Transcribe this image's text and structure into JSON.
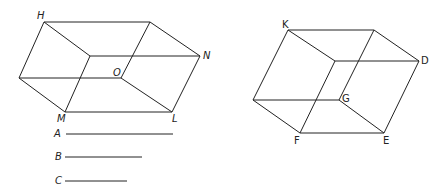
{
  "figure_left": {
    "labels": {
      "H": "H",
      "N": "N",
      "O": "O",
      "M": "M",
      "L": "L"
    },
    "vertices": {
      "H": [
        44,
        22
      ],
      "BR": [
        150,
        22
      ],
      "FTL": [
        90,
        56
      ],
      "N": [
        200,
        56
      ],
      "LEFT": [
        19,
        78
      ],
      "O": [
        121,
        78
      ],
      "M": [
        65,
        112
      ],
      "L": [
        172,
        112
      ]
    }
  },
  "figure_right": {
    "labels": {
      "K": "K",
      "D": "D",
      "G": "G",
      "F": "F",
      "E": "E"
    },
    "vertices": {
      "K": [
        288,
        30
      ],
      "BR": [
        374,
        30
      ],
      "FT": [
        335,
        61
      ],
      "D": [
        419,
        61
      ],
      "LEFT": [
        253,
        100
      ],
      "G": [
        339,
        100
      ],
      "F": [
        300,
        133
      ],
      "E": [
        384,
        133
      ]
    }
  },
  "segments": [
    {
      "label": "A",
      "length_px": 107
    },
    {
      "label": "B",
      "length_px": 77
    },
    {
      "label": "C",
      "length_px": 62
    }
  ],
  "colors": {
    "line": "#222222",
    "background": "#ffffff"
  }
}
